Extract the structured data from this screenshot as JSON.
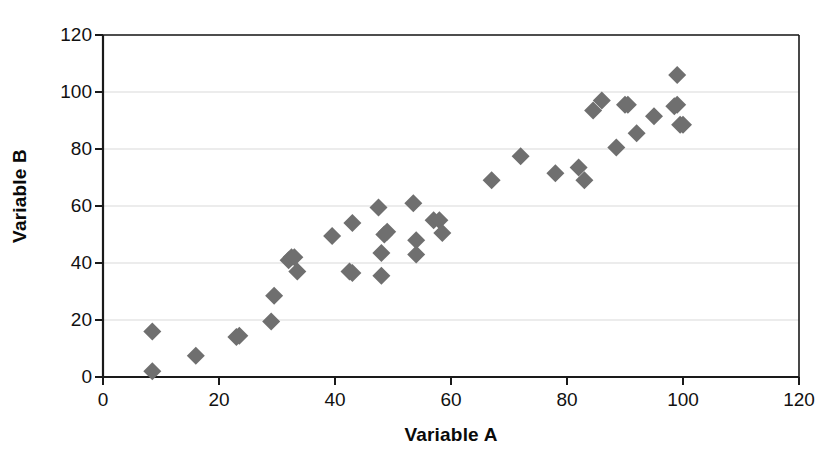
{
  "chart_data": {
    "type": "scatter",
    "title": "",
    "xlabel": "Variable A",
    "ylabel": "Variable B",
    "xlim": [
      0,
      120
    ],
    "ylim": [
      0,
      120
    ],
    "xticks": [
      0,
      20,
      40,
      60,
      80,
      100,
      120
    ],
    "yticks": [
      0,
      20,
      40,
      60,
      80,
      100,
      120
    ],
    "xtick_labels": [
      "0",
      "20",
      "40",
      "60",
      "80",
      "100",
      "120"
    ],
    "ytick_labels": [
      "0",
      "20",
      "40",
      "60",
      "80",
      "100",
      "120"
    ],
    "grid": "horizontal",
    "legend": "none",
    "marker": "diamond",
    "marker_color": "#6f6f6f",
    "marker_size": 9,
    "axis_color": "#1a1a1a",
    "gridline_color": "#d9d9d9",
    "background": "#ffffff",
    "series": [
      {
        "name": "Variable A vs Variable B",
        "points": [
          [
            8.5,
            2
          ],
          [
            8.5,
            16
          ],
          [
            16,
            7.5
          ],
          [
            23,
            14
          ],
          [
            23.5,
            14.5
          ],
          [
            29,
            19.5
          ],
          [
            29.5,
            28.5
          ],
          [
            32,
            41
          ],
          [
            32.5,
            42
          ],
          [
            33,
            42
          ],
          [
            33.5,
            37
          ],
          [
            39.5,
            49.5
          ],
          [
            42.5,
            37
          ],
          [
            43,
            36.5
          ],
          [
            43,
            54
          ],
          [
            47.5,
            59.5
          ],
          [
            48,
            35.5
          ],
          [
            48,
            43.5
          ],
          [
            48.5,
            50
          ],
          [
            49,
            51
          ],
          [
            53.5,
            61
          ],
          [
            54,
            43
          ],
          [
            54,
            48
          ],
          [
            57,
            55
          ],
          [
            58,
            55
          ],
          [
            58.5,
            50.5
          ],
          [
            67,
            69
          ],
          [
            72,
            77.5
          ],
          [
            78,
            71.5
          ],
          [
            82,
            73.5
          ],
          [
            83,
            69
          ],
          [
            84.5,
            93.5
          ],
          [
            86,
            97
          ],
          [
            88.5,
            80.5
          ],
          [
            90,
            95.5
          ],
          [
            90.5,
            95.5
          ],
          [
            92,
            85.5
          ],
          [
            95,
            91.5
          ],
          [
            98.5,
            95
          ],
          [
            99,
            95.5
          ],
          [
            99,
            106
          ],
          [
            99.5,
            88.5
          ],
          [
            100,
            88.5
          ]
        ]
      }
    ]
  },
  "axes": {
    "x_title": "Variable A",
    "y_title": "Variable B"
  }
}
